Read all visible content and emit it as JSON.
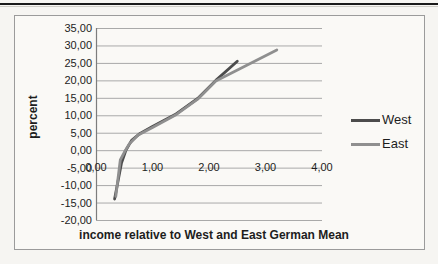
{
  "colors": {
    "page_bg": "#f6f5f2",
    "rule": "#1a1a1a",
    "chart_border": "#9b9b9b",
    "gridline": "#a9a9a9",
    "axis": "#7d7d7d",
    "text": "#1d1d1d",
    "west": "#4c4c4c",
    "east": "#8f8f8f"
  },
  "chart_data": {
    "type": "line",
    "title": "",
    "xlabel": "income relative to West and East German Mean",
    "ylabel": "percent",
    "xlim": [
      0,
      4
    ],
    "ylim": [
      -20,
      35
    ],
    "grid": "horizontal",
    "legend_position": "right",
    "xticks": {
      "values": [
        0,
        1,
        2,
        3,
        4
      ],
      "labels": [
        "0,00",
        "1,00",
        "2,00",
        "3,00",
        "4,00"
      ]
    },
    "yticks": {
      "values": [
        35,
        30,
        25,
        20,
        15,
        10,
        5,
        0,
        -5,
        -10,
        -15,
        -20
      ],
      "labels": [
        "35,00",
        "30,00",
        "25,00",
        "20,00",
        "15,00",
        "10,00",
        "5,00",
        "0,00",
        "-5,00",
        "-10,00",
        "-15,00",
        "-20,00"
      ]
    },
    "series": [
      {
        "name": "West",
        "color": "#4c4c4c",
        "points": [
          [
            0.33,
            -14.0
          ],
          [
            0.45,
            -3.8
          ],
          [
            0.53,
            0.0
          ],
          [
            0.63,
            2.8
          ],
          [
            0.78,
            4.8
          ],
          [
            1.0,
            6.8
          ],
          [
            1.4,
            10.2
          ],
          [
            1.8,
            14.8
          ],
          [
            2.12,
            20.0
          ],
          [
            2.5,
            25.5
          ]
        ]
      },
      {
        "name": "East",
        "color": "#8f8f8f",
        "points": [
          [
            0.35,
            -13.2
          ],
          [
            0.43,
            -2.8
          ],
          [
            0.5,
            -0.6
          ],
          [
            0.59,
            1.8
          ],
          [
            0.74,
            4.3
          ],
          [
            1.0,
            6.5
          ],
          [
            1.4,
            10.0
          ],
          [
            1.8,
            14.6
          ],
          [
            2.12,
            19.8
          ],
          [
            3.2,
            28.7
          ]
        ]
      }
    ]
  }
}
